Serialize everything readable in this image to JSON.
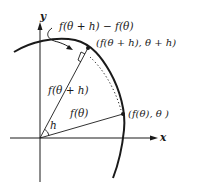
{
  "diagram": {
    "axes": {
      "x_label": "x",
      "y_label": "y"
    },
    "labels": {
      "difference": "f(θ + h) − f(θ)",
      "point_upper": "(f(θ + h), θ + h)",
      "radius_upper": "f(θ + h)",
      "radius_lower": "f(θ)",
      "point_lower": "(f(θ), θ )",
      "angle": "h"
    },
    "colors": {
      "ink": "#1a1a1a",
      "background": "#ffffff"
    }
  }
}
